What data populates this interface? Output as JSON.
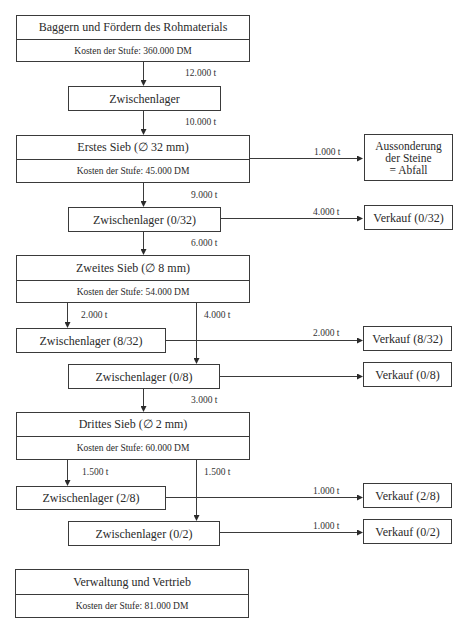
{
  "stages": {
    "baggern": {
      "title": "Baggern und Fördern des Rohmaterials",
      "cost": "Kosten der Stufe: 360.000 DM"
    },
    "sieb1": {
      "title": "Erstes Sieb (∅  32 mm)",
      "cost": "Kosten der Stufe: 45.000 DM"
    },
    "sieb2": {
      "title": "Zweites Sieb (∅  8 mm)",
      "cost": "Kosten der Stufe: 54.000 DM"
    },
    "sieb3": {
      "title": "Drittes Sieb (∅  2 mm)",
      "cost": "Kosten der Stufe: 60.000 DM"
    },
    "verwaltung": {
      "title": "Verwaltung und Vertrieb",
      "cost": "Kosten der Stufe: 81.000 DM"
    }
  },
  "storage": {
    "z0": "Zwischenlager",
    "z0_32": "Zwischenlager (0/32)",
    "z8_32": "Zwischenlager (8/32)",
    "z0_8": "Zwischenlager (0/8)",
    "z2_8": "Zwischenlager (2/8)",
    "z0_2": "Zwischenlager (0/2)"
  },
  "outputs": {
    "abfall": [
      "Aussonderung",
      "der Steine",
      "= Abfall"
    ],
    "v0_32": "Verkauf (0/32)",
    "v8_32": "Verkauf (8/32)",
    "v0_8": "Verkauf (0/8)",
    "v2_8": "Verkauf (2/8)",
    "v0_2": "Verkauf (0/2)"
  },
  "flows": {
    "baggern_to_z0": "12.000 t",
    "z0_to_sieb1": "10.000 t",
    "sieb1_to_abfall": "1.000 t",
    "sieb1_to_z0_32": "9.000 t",
    "z0_32_to_v0_32": "4.000 t",
    "z0_32_to_sieb2": "6.000 t",
    "sieb2_to_z8_32": "2.000 t",
    "sieb2_to_z0_8": "4.000 t",
    "z8_32_to_v8_32": "2.000 t",
    "z0_8_to_sieb3": "3.000 t",
    "sieb3_to_z2_8": "1.500 t",
    "sieb3_to_z0_2": "1.500 t",
    "z2_8_to_v2_8": "1.000 t",
    "z0_2_to_v0_2": "1.000 t"
  },
  "colors": {
    "line": "#3a3a3a",
    "text": "#2a2a2a"
  }
}
